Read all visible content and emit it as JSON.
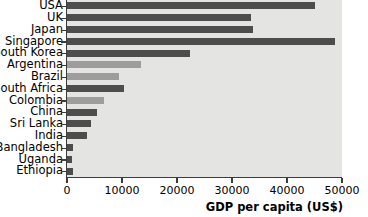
{
  "chart_data": {
    "type": "bar",
    "orientation": "horizontal",
    "title": "",
    "xlabel": "GDP per capita (US$)",
    "ylabel": "",
    "xlim": [
      0,
      50000
    ],
    "ylim": null,
    "grid": false,
    "legend": null,
    "xticks": [
      0,
      10000,
      20000,
      30000,
      40000,
      50000
    ],
    "xtick_labels": [
      "0",
      "10000",
      "20000",
      "30000",
      "40000",
      "50000"
    ],
    "categories": [
      "USA",
      "UK",
      "Japan",
      "Singapore",
      "South Korea",
      "Argentina",
      "Brazil",
      "South Africa",
      "Colombia",
      "China",
      "Sri Lanka",
      "India",
      "Bangladesh",
      "Uganda",
      "Ethiopia"
    ],
    "values": [
      45000,
      33500,
      33800,
      48800,
      22300,
      13500,
      9400,
      10300,
      6700,
      5500,
      4400,
      3700,
      1050,
      950,
      1000
    ],
    "bar_shades": [
      "dark",
      "dark",
      "dark",
      "dark",
      "dark",
      "light",
      "light",
      "dark",
      "light",
      "dark",
      "dark",
      "dark",
      "dark",
      "dark",
      "dark"
    ]
  },
  "colors": {
    "plot_background": "#e4e4e2",
    "bar_dark": "#4d4d4d",
    "bar_light": "#9d9d9d",
    "axis": "#3c3c3c",
    "text": "#000000",
    "page_background": "#ffffff"
  }
}
